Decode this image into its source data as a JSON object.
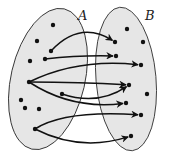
{
  "diagram": {
    "sets": [
      {
        "id": "A",
        "label": "A",
        "element_count": 11
      },
      {
        "id": "B",
        "label": "B",
        "element_count": 10
      }
    ],
    "colors": {
      "set_fill": "#e6e6e6",
      "set_stroke": "#333333",
      "ink": "#111111"
    },
    "elements_A": [
      "a1",
      "a2",
      "a3",
      "a4",
      "a5",
      "a6",
      "a7",
      "a8",
      "a9",
      "a10",
      "a11"
    ],
    "elements_B": [
      "b1",
      "b2",
      "b3",
      "b4",
      "b5",
      "b6",
      "b7",
      "b8",
      "b9",
      "b10"
    ],
    "mappings": [
      {
        "from": "a4",
        "to": "b2"
      },
      {
        "from": "a5",
        "to": "b4"
      },
      {
        "from": "a6",
        "to": "b5"
      },
      {
        "from": "a6",
        "to": "b6"
      },
      {
        "from": "a6",
        "to": "b8"
      },
      {
        "from": "a10",
        "to": "b6"
      },
      {
        "from": "a11",
        "to": "b9"
      },
      {
        "from": "a11",
        "to": "b10"
      }
    ]
  }
}
